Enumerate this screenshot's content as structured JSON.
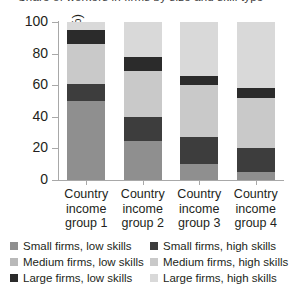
{
  "title": {
    "text": "Share of workers in firms by size and skill type",
    "cropped": true
  },
  "axis": {
    "ylabel": "Share of workers (%)",
    "yticks": [
      0,
      20,
      40,
      60,
      80,
      100
    ],
    "ylim": [
      0,
      100
    ],
    "xlabel": ""
  },
  "legend": {
    "position": "bottom",
    "items": [
      {
        "label": "Small firms, low skills",
        "color": "#8f8f8f",
        "key": "small_low"
      },
      {
        "label": "Small firms, high skills",
        "color": "#3d3d3d",
        "key": "small_high"
      },
      {
        "label": "Medium firms, low skills",
        "color": "#b9b9b9",
        "key": "medium_low"
      },
      {
        "label": "Medium firms, high skills",
        "color": "#c9c9c9",
        "key": "medium_high"
      },
      {
        "label": "Large firms, low skills",
        "color": "#2b2b2b",
        "key": "large_low"
      },
      {
        "label": "Large firms, high skills",
        "color": "#d9d9d9",
        "key": "large_high"
      }
    ]
  },
  "chart_data": {
    "type": "bar",
    "subtype": "stacked-100",
    "title": "Share of workers in firms by size and skill type",
    "xlabel": "",
    "ylabel": "Share of workers (%)",
    "ylim": [
      0,
      100
    ],
    "yticks": [
      0,
      20,
      40,
      60,
      80,
      100
    ],
    "grid": false,
    "legend_position": "bottom",
    "categories": [
      "Country income group 1",
      "Country income group 2",
      "Country income group 3",
      "Country income group 4"
    ],
    "category_lines": [
      [
        "Country",
        "income",
        "group 1"
      ],
      [
        "Country",
        "income",
        "group 2"
      ],
      [
        "Country",
        "income",
        "group 3"
      ],
      [
        "Country",
        "income",
        "group 4"
      ]
    ],
    "series": [
      {
        "name": "Small firms, low skills",
        "color": "#8f8f8f",
        "values": [
          50,
          25,
          10,
          5
        ]
      },
      {
        "name": "Small firms, high skills",
        "color": "#3d3d3d",
        "values": [
          11,
          15,
          17,
          15
        ]
      },
      {
        "name": "Medium firms, low skills",
        "color": "#b9b9b9",
        "values": [
          0,
          0,
          0,
          0
        ]
      },
      {
        "name": "Medium firms, high skills",
        "color": "#c9c9c9",
        "values": [
          25,
          29,
          33,
          32
        ]
      },
      {
        "name": "Large firms, low skills",
        "color": "#2b2b2b",
        "values": [
          9,
          9,
          6,
          6
        ]
      },
      {
        "name": "Large firms, high skills",
        "color": "#d9d9d9",
        "values": [
          5,
          22,
          34,
          42
        ]
      }
    ]
  }
}
